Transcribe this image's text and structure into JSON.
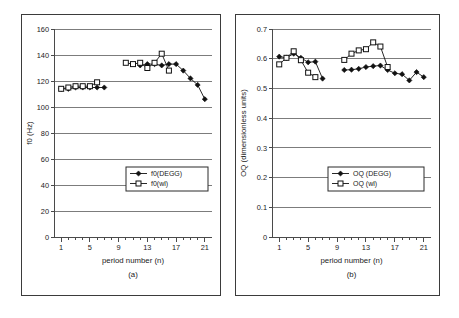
{
  "figure": {
    "panels": [
      "a",
      "b"
    ],
    "background": "#ffffff",
    "line_color": "#111111"
  },
  "panel_a": {
    "caption": "(a)",
    "xlabel": "period number (n)",
    "ylabel": "f0 (Hz)",
    "legend": {
      "entries": [
        "f0(DEGG)",
        "f0(wl)"
      ]
    }
  },
  "panel_b": {
    "caption": "(b)",
    "xlabel": "period number (n)",
    "ylabel": "OQ (dimensionless units)",
    "legend": {
      "entries": [
        "OQ (DEGG)",
        "OQ (wl)"
      ]
    }
  },
  "chart_data": [
    {
      "type": "scatter",
      "panel": "a",
      "title": "",
      "xlabel": "period number (n)",
      "ylabel": "f0 (Hz)",
      "xlim": [
        0,
        22
      ],
      "ylim": [
        0,
        160
      ],
      "xticks": [
        1,
        5,
        9,
        13,
        17,
        21
      ],
      "yticks": [
        0,
        20,
        40,
        60,
        80,
        100,
        120,
        140,
        160
      ],
      "ytick_labels": [
        "0",
        "20",
        "40",
        "60",
        "80",
        "100",
        "120",
        "140",
        "160"
      ],
      "xtick_labels": [
        "1",
        "5",
        "9",
        "13",
        "17",
        "21"
      ],
      "grid": "horizontal",
      "legend_position": "inner-right",
      "series": [
        {
          "name": "f0(DEGG)",
          "marker": "filled-diamond",
          "segments": [
            {
              "x": [
                1,
                2,
                3,
                4,
                5,
                6,
                7
              ],
              "y": [
                114,
                114,
                115,
                115,
                115,
                115,
                115
              ]
            },
            {
              "x": [
                12,
                13,
                14,
                15,
                16,
                17,
                18,
                19,
                20,
                21
              ],
              "y": [
                132,
                133,
                133,
                132,
                133,
                133,
                128,
                122,
                117,
                106
              ]
            }
          ]
        },
        {
          "name": "f0(wl)",
          "marker": "open-square",
          "segments": [
            {
              "x": [
                1,
                2,
                3,
                4,
                5,
                6
              ],
              "y": [
                114,
                115,
                116,
                116,
                116,
                119
              ]
            },
            {
              "x": [
                10,
                11,
                12,
                13,
                14,
                15,
                16
              ],
              "y": [
                134,
                133,
                134,
                130,
                134,
                141,
                128
              ]
            }
          ]
        }
      ]
    },
    {
      "type": "scatter",
      "panel": "b",
      "title": "",
      "xlabel": "period number (n)",
      "ylabel": "OQ (dimensionless units)",
      "xlim": [
        0,
        22
      ],
      "ylim": [
        0,
        0.7
      ],
      "xticks": [
        1,
        5,
        9,
        13,
        17,
        21
      ],
      "yticks": [
        0,
        0.1,
        0.2,
        0.3,
        0.4,
        0.5,
        0.6,
        0.7
      ],
      "ytick_labels": [
        "0",
        "0.1",
        "0.2",
        "0.3",
        "0.4",
        "0.5",
        "0.6",
        "0.7"
      ],
      "xtick_labels": [
        "1",
        "5",
        "9",
        "13",
        "17",
        "21"
      ],
      "grid": "horizontal",
      "legend_position": "inner-right",
      "series": [
        {
          "name": "OQ (DEGG)",
          "marker": "filled-diamond",
          "segments": [
            {
              "x": [
                1,
                2,
                3,
                4,
                5,
                6,
                7
              ],
              "y": [
                0.607,
                0.603,
                0.617,
                0.603,
                0.588,
                0.59,
                0.533
              ]
            },
            {
              "x": [
                10,
                11,
                12,
                13,
                14,
                15,
                16,
                17,
                18,
                19,
                20,
                21
              ],
              "y": [
                0.562,
                0.563,
                0.566,
                0.572,
                0.575,
                0.577,
                0.562,
                0.551,
                0.548,
                0.527,
                0.555,
                0.538
              ]
            }
          ]
        },
        {
          "name": "OQ (wl)",
          "marker": "open-square",
          "segments": [
            {
              "x": [
                1,
                2,
                3,
                4,
                5,
                6
              ],
              "y": [
                0.581,
                0.603,
                0.625,
                0.595,
                0.553,
                0.538
              ]
            },
            {
              "x": [
                10,
                11,
                12,
                13,
                14,
                15,
                16
              ],
              "y": [
                0.596,
                0.617,
                0.628,
                0.632,
                0.655,
                0.641,
                0.572
              ]
            }
          ]
        }
      ]
    }
  ]
}
